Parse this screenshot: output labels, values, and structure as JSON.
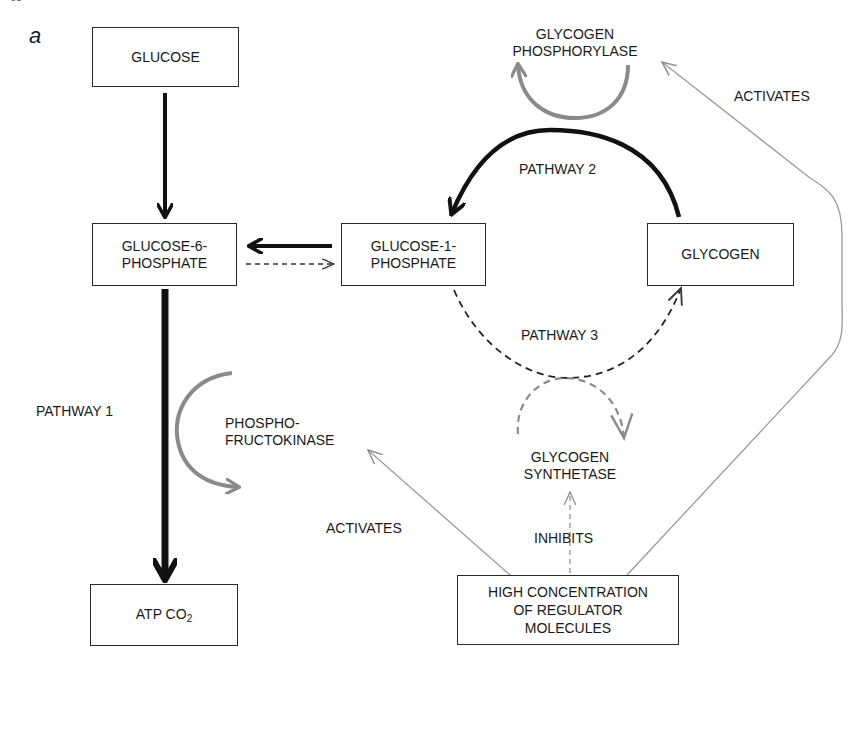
{
  "page": {
    "number": "68",
    "panel_letter": "a"
  },
  "nodes": {
    "glucose": "GLUCOSE",
    "g6p_line1": "GLUCOSE-6-",
    "g6p_line2": "PHOSPHATE",
    "g1p_line1": "GLUCOSE-1-",
    "g1p_line2": "PHOSPHATE",
    "glycogen": "GLYCOGEN",
    "atp_main": "ATP CO",
    "atp_sub": "2",
    "regulator_line1": "HIGH CONCENTRATION",
    "regulator_line2": "OF REGULATOR",
    "regulator_line3": "MOLECULES"
  },
  "enzymes": {
    "phosphorylase_line1": "GLYCOGEN",
    "phosphorylase_line2": "PHOSPHORYLASE",
    "pfk_line1": "PHOSPHO-",
    "pfk_line2": "FRUCTOKINASE",
    "synthetase_line1": "GLYCOGEN",
    "synthetase_line2": "SYNTHETASE"
  },
  "labels": {
    "pathway1": "PATHWAY 1",
    "pathway2": "PATHWAY 2",
    "pathway3": "PATHWAY 3",
    "activates_right": "ACTIVATES",
    "activates_left": "ACTIVATES",
    "inhibits": "INHIBITS"
  },
  "colors": {
    "ink": "#1a1a1a",
    "enzyme_gray": "#8a8a8a",
    "regulator_line": "#9a9a9a"
  }
}
